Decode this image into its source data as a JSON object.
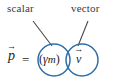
{
  "figure": {
    "background_color": "#ffffff"
  },
  "annotations": {
    "scalar_label": "scalar",
    "vector_label": "vector",
    "label_color": "#3a3a3a",
    "leader_line_color": "#4a4a4a"
  },
  "equation": {
    "momentum_symbol": "p",
    "momentum_arrow": "→",
    "equals": "=",
    "scalar_open_paren": "(",
    "gamma": "γ",
    "mass": "m",
    "scalar_close_paren": ")",
    "velocity_symbol": "v",
    "velocity_arrow": "→",
    "text_color": "#1d1d1d"
  },
  "circles": {
    "accent_color": "#2f6fa8",
    "scalar_circle_name": "scalar-term-circle",
    "vector_circle_name": "vector-term-circle"
  }
}
